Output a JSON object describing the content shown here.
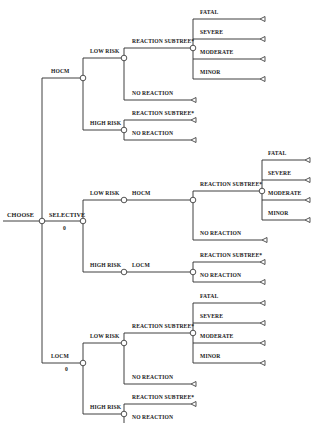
{
  "diagram": {
    "type": "decision-tree",
    "root": {
      "label": "CHOOSE",
      "strategies": [
        {
          "label": "HOCM",
          "branches": [
            {
              "label": "LOW RISK",
              "outcomes": [
                {
                  "label": "REACTION SUBTREE*",
                  "subtree": [
                    "FATAL",
                    "SEVERE",
                    "MODERATE",
                    "MINOR"
                  ]
                },
                {
                  "label": "NO REACTION"
                }
              ]
            },
            {
              "label": "HIGH RISK",
              "outcomes": [
                {
                  "label": "REACTION SUBTREE*"
                },
                {
                  "label": "NO REACTION"
                }
              ]
            }
          ]
        },
        {
          "label": "SELECTIVE",
          "value": "0",
          "branches": [
            {
              "label": "LOW RISK",
              "agent": "HOCM",
              "outcomes": [
                {
                  "label": "REACTION SUBTREE*",
                  "subtree": [
                    "FATAL",
                    "SEVERE",
                    "MODERATE",
                    "MINOR"
                  ]
                },
                {
                  "label": "NO REACTION"
                }
              ]
            },
            {
              "label": "HIGH RISK",
              "agent": "LOCM",
              "outcomes": [
                {
                  "label": "REACTION SUBTREE*"
                },
                {
                  "label": "NO REACTION"
                }
              ]
            }
          ]
        },
        {
          "label": "LOCM",
          "value": "0",
          "branches": [
            {
              "label": "LOW RISK",
              "outcomes": [
                {
                  "label": "REACTION SUBTREE*",
                  "subtree": [
                    "FATAL",
                    "SEVERE",
                    "MODERATE",
                    "MINOR"
                  ]
                },
                {
                  "label": "NO REACTION"
                }
              ]
            },
            {
              "label": "HIGH RISK",
              "outcomes": [
                {
                  "label": "REACTION SUBTREE*"
                },
                {
                  "label": "NO REACTION"
                }
              ]
            }
          ]
        }
      ]
    }
  },
  "labels": {
    "choose": "CHOOSE",
    "hocm": "HOCM",
    "locm": "LOCM",
    "selective": "SELECTIVE",
    "selective_value": "0",
    "locm_value": "0",
    "low_risk": "LOW RISK",
    "high_risk": "HIGH RISK",
    "reaction_subtree": "REACTION SUBTREE*",
    "no_reaction": "NO REACTION",
    "fatal": "FATAL",
    "severe": "SEVERE",
    "moderate": "MODERATE",
    "minor": "MINOR"
  },
  "colors": {
    "line": "#2a2a2a",
    "text": "#1a1a1a",
    "background": "#ffffff"
  }
}
